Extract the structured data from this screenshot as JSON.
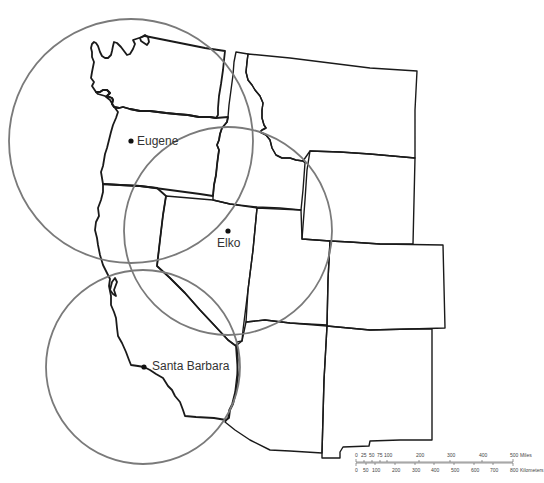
{
  "map": {
    "title": "",
    "cities": [
      {
        "name": "Eugene",
        "x": 130,
        "y": 141,
        "label_x": 137,
        "label_y": 145,
        "radius": 122,
        "circle_cx": 131,
        "circle_cy": 141
      },
      {
        "name": "Elko",
        "x": 228,
        "y": 231,
        "label_x": 217,
        "label_y": 247,
        "radius": 104,
        "circle_cx": 228,
        "circle_cy": 231
      },
      {
        "name": "Santa Barbara",
        "x": 144,
        "y": 367,
        "label_x": 152,
        "label_y": 370,
        "radius": 97,
        "circle_cx": 143,
        "circle_cy": 367
      }
    ],
    "colors": {
      "boundary": "#1a1a1a",
      "range_circle": "#7a7a7a",
      "background": "#ffffff"
    }
  },
  "scale_bar": {
    "miles_label": "Miles",
    "kilometers_label": "Kilometers",
    "miles_ticks": [
      "0",
      "25",
      "50",
      "75",
      "100",
      "200",
      "300",
      "400",
      "500"
    ],
    "kilometers_ticks": [
      "0",
      "50",
      "100",
      "200",
      "300",
      "400",
      "500",
      "600",
      "700",
      "800"
    ]
  }
}
